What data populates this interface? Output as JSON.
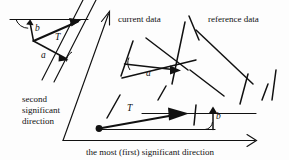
{
  "figure": {
    "type": "geometric-diagram",
    "background_color": "#fdfdfd",
    "ink_color": "#111111",
    "labels": {
      "current_data": "current data",
      "reference_data": "reference data",
      "second_axis_line1": "second",
      "second_axis_line2": "significant",
      "second_axis_line3": "direction",
      "first_axis": "the most (first) significant direction"
    },
    "vector_labels": {
      "inset_b": "b",
      "inset_T": "T",
      "inset_a": "a",
      "current_a": "a",
      "main_T": "T",
      "main_b": "b"
    },
    "axes": {
      "horizontal": {
        "name": "the most (first) significant direction",
        "arrow": "right"
      },
      "oblique": {
        "name": "second significant direction",
        "arrow": "up-right"
      }
    },
    "groups": [
      {
        "name": "current data",
        "segments": 4
      },
      {
        "name": "reference data",
        "segments": 4
      }
    ]
  }
}
